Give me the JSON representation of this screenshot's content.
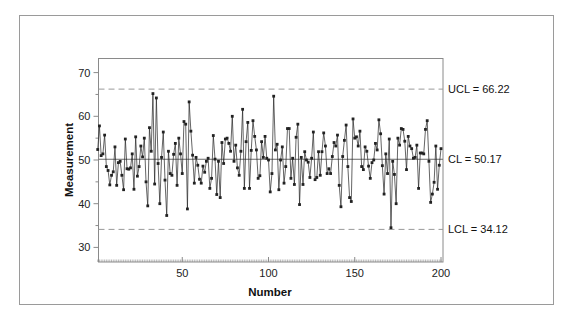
{
  "chart_data": {
    "type": "line",
    "subtype": "individuals-control-chart",
    "title": "",
    "xlabel": "Number",
    "ylabel": "Measurement",
    "xlim": [
      0,
      200
    ],
    "ylim": [
      27,
      73
    ],
    "x_ticks": [
      50,
      100,
      150,
      200
    ],
    "x_tick_labels": [
      "50",
      "100",
      "150",
      "200"
    ],
    "x_minor_tick_step": 1,
    "y_ticks": [
      30,
      40,
      50,
      60,
      70
    ],
    "y_tick_labels": [
      "30",
      "40",
      "50",
      "60",
      "70"
    ],
    "y_minor_ticks": [
      35,
      45,
      55,
      65
    ],
    "grid": false,
    "legend": "none",
    "control_limits": [
      {
        "name": "UCL",
        "value": 66.22,
        "label": "UCL = 66.22",
        "style": "dashed"
      },
      {
        "name": "CL",
        "value": 50.17,
        "label": "CL = 50.17",
        "style": "solid"
      },
      {
        "name": "LCL",
        "value": 34.12,
        "label": "LCL = 34.12",
        "style": "dashed"
      }
    ],
    "series": [
      {
        "name": "Measurement",
        "marker": "square",
        "color": "#222222",
        "values": [
          52.4,
          57.8,
          51.0,
          51.4,
          55.7,
          48.5,
          47.6,
          44.3,
          46.5,
          47.3,
          53.0,
          44.2,
          49.4,
          49.7,
          46.5,
          43.2,
          54.8,
          48.0,
          47.9,
          48.2,
          51.4,
          43.3,
          55.3,
          46.3,
          48.5,
          53.2,
          50.7,
          55.0,
          45.0,
          39.5,
          57.4,
          52.0,
          65.2,
          44.5,
          64.2,
          49.2,
          40.0,
          50.6,
          56.4,
          45.4,
          37.3,
          52.0,
          46.9,
          46.5,
          51.3,
          53.8,
          44.2,
          55.0,
          51.4,
          46.9,
          58.8,
          58.2,
          38.8,
          63.3,
          56.6,
          51.1,
          44.7,
          50.6,
          48.8,
          45.6,
          44.7,
          48.6,
          47.2,
          49.7,
          50.4,
          43.5,
          45.8,
          55.6,
          50.2,
          42.1,
          49.7,
          41.4,
          54.0,
          49.2,
          54.8,
          55.0,
          53.8,
          52.0,
          60.0,
          49.7,
          53.4,
          48.2,
          46.5,
          52.0,
          61.6,
          43.5,
          54.2,
          58.6,
          43.5,
          52.2,
          59.0,
          55.4,
          52.3,
          45.8,
          46.4,
          54.2,
          50.6,
          55.4,
          50.4,
          50.0,
          42.7,
          46.9,
          64.6,
          52.3,
          53.6,
          43.2,
          50.0,
          53.0,
          44.7,
          48.5,
          57.2,
          57.2,
          45.8,
          50.4,
          44.4,
          55.2,
          58.2,
          39.8,
          50.6,
          44.4,
          51.9,
          50.0,
          49.5,
          46.0,
          50.4,
          56.4,
          45.5,
          46.0,
          51.9,
          46.5,
          51.9,
          56.2,
          53.2,
          46.9,
          48.0,
          46.9,
          50.8,
          54.0,
          53.2,
          55.7,
          44.2,
          39.3,
          50.8,
          54.5,
          58.0,
          48.5,
          41.4,
          40.5,
          59.4,
          55.0,
          55.3,
          53.2,
          56.6,
          48.5,
          47.8,
          53.0,
          52.0,
          48.6,
          45.8,
          49.4,
          50.0,
          53.8,
          52.3,
          59.2,
          56.0,
          48.7,
          42.2,
          51.4,
          46.9,
          54.8,
          34.5,
          49.7,
          46.7,
          40.0,
          55.0,
          53.4,
          57.2,
          57.0,
          54.3,
          47.8,
          55.4,
          53.2,
          52.6,
          50.4,
          50.6,
          53.4,
          43.5,
          51.6,
          51.6,
          51.4,
          57.0,
          59.0,
          49.7,
          40.3,
          42.2,
          44.9,
          53.2,
          43.3,
          48.8,
          52.6
        ]
      }
    ]
  },
  "labels": {
    "xlabel": "Number",
    "ylabel": "Measurement",
    "ucl": "UCL = 66.22",
    "cl": "CL = 50.17",
    "lcl": "LCL = 34.12",
    "x_ticks": [
      "50",
      "100",
      "150",
      "200"
    ],
    "y_ticks": [
      "30",
      "40",
      "50",
      "60",
      "70"
    ]
  },
  "colors": {
    "frame": "#9a9a9a",
    "axis": "#8a8a8a",
    "series": "#222222",
    "limits": "#9a9a9a",
    "center": "#6a6a6a"
  }
}
